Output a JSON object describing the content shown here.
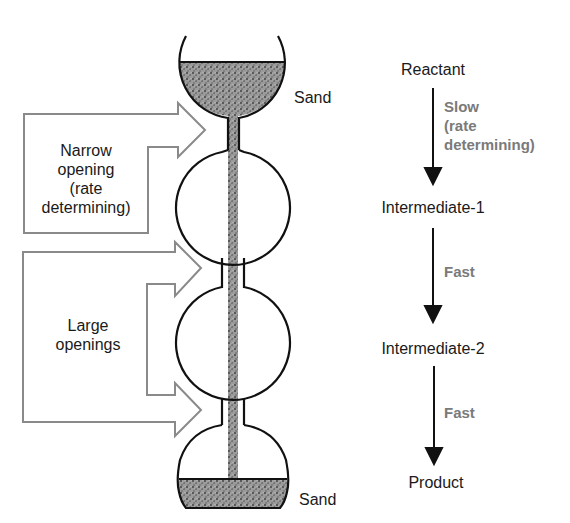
{
  "diagram": {
    "type": "hourglass-analogy-of-rate-determining-step",
    "colors": {
      "outline": "#111111",
      "sand": "#8c8c8c",
      "arrow_outline": "#8a8a8a",
      "rate_text": "#7a7a7a"
    },
    "hourglass": {
      "top_label": "Sand",
      "bottom_label": "Sand"
    },
    "callouts": {
      "narrow": {
        "line1": "Narrow",
        "line2": "opening",
        "line3": "(rate",
        "line4": "determining)"
      },
      "large": {
        "line1": "Large",
        "line2": "openings"
      }
    },
    "mechanism": {
      "species": [
        "Reactant",
        "Intermediate-1",
        "Intermediate-2",
        "Product"
      ],
      "steps": [
        {
          "from": "Reactant",
          "to": "Intermediate-1",
          "line1": "Slow",
          "line2": "(rate",
          "line3": "determining)"
        },
        {
          "from": "Intermediate-1",
          "to": "Intermediate-2",
          "line1": "Fast"
        },
        {
          "from": "Intermediate-2",
          "to": "Product",
          "line1": "Fast"
        }
      ]
    }
  }
}
